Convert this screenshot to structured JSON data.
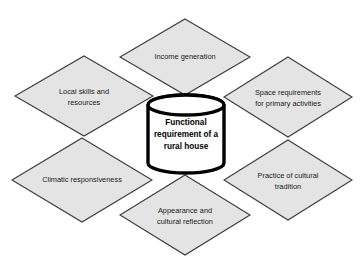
{
  "diagram": {
    "type": "radial-hub-and-spoke",
    "title": "Functional requirement of a rural house",
    "center": {
      "shape": "cylinder",
      "label_lines": [
        "Functional",
        "requirement of a",
        "rural house"
      ],
      "fill_color": "#ffffff",
      "border_color": "#000000"
    },
    "node_fill_color": "#e4e4e4",
    "node_border_color": "#3a3a3a",
    "background_color": "#ffffff",
    "nodes": [
      {
        "id": "income-generation",
        "position": "top",
        "label_lines": [
          "Income generation"
        ],
        "cx": 185,
        "cy": 57,
        "rx": 65,
        "ry": 38
      },
      {
        "id": "local-skills-and-resources",
        "position": "upper-left",
        "label_lines": [
          "Local skills and",
          "resources"
        ],
        "cx": 84,
        "cy": 96,
        "rx": 69,
        "ry": 40
      },
      {
        "id": "space-requirements-for-primary-activities",
        "position": "upper-right",
        "label_lines": [
          "Space requirements",
          "for primary activities"
        ],
        "cx": 288,
        "cy": 97,
        "rx": 64,
        "ry": 40
      },
      {
        "id": "climatic-responsiveness",
        "position": "lower-left",
        "label_lines": [
          "Climatic responsiveness"
        ],
        "cx": 82,
        "cy": 180,
        "rx": 70,
        "ry": 42
      },
      {
        "id": "practice-of-cultural-tradition",
        "position": "lower-right",
        "label_lines": [
          "Practice of cultural",
          "tradition"
        ],
        "cx": 288,
        "cy": 180,
        "rx": 64,
        "ry": 40
      },
      {
        "id": "appearance-and-cultural-reflection",
        "position": "bottom",
        "label_lines": [
          "Appearance and",
          "cultural reflection"
        ],
        "cx": 185,
        "cy": 215,
        "rx": 65,
        "ry": 40
      }
    ]
  }
}
